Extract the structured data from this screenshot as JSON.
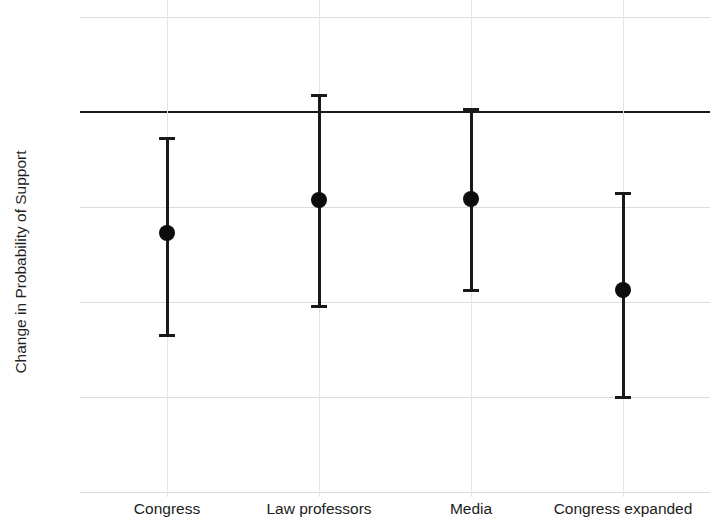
{
  "chart_data": {
    "type": "scatter",
    "title": "",
    "subtitle": "",
    "xlabel": "",
    "ylabel": "Change in Probability of Support",
    "categories": [
      "Congress",
      "Law professors",
      "Media",
      "Congress expanded"
    ],
    "values": [
      -0.127,
      -0.093,
      -0.092,
      -0.187
    ],
    "ci_low": [
      -0.235,
      -0.204,
      -0.187,
      -0.3
    ],
    "ci_high": [
      -0.027,
      0.018,
      0.003,
      -0.085
    ],
    "series": [
      {
        "name": "Change in Probability of Support",
        "values": [
          -0.127,
          -0.093,
          -0.092,
          -0.187
        ],
        "ci_low": [
          -0.235,
          -0.204,
          -0.187,
          -0.3
        ],
        "ci_high": [
          -0.027,
          0.018,
          0.003,
          -0.085
        ]
      }
    ],
    "points": [
      {
        "category": "Congress",
        "estimate": -0.127,
        "ci_low": -0.235,
        "ci_high": -0.027
      },
      {
        "category": "Law professors",
        "estimate": -0.093,
        "ci_low": -0.204,
        "ci_high": 0.018
      },
      {
        "category": "Media",
        "estimate": -0.092,
        "ci_low": -0.187,
        "ci_high": 0.003
      },
      {
        "category": "Congress expanded",
        "estimate": -0.187,
        "ci_low": -0.3,
        "ci_high": -0.085
      }
    ],
    "ylim": [
      -0.4,
      0.1
    ],
    "yticks": [
      0.1,
      0,
      -0.1,
      -0.2,
      -0.3,
      -0.4
    ],
    "ytick_labels": [
      ".1",
      "0",
      "-.1",
      "-.2",
      "-.3",
      "-.4"
    ],
    "grid": true,
    "zero_line": true,
    "legend": null,
    "legend_position": "none",
    "marker": "filled-circle",
    "colors": {
      "marker": "#0d0d0d",
      "error_bar": "#191919",
      "gridline": "#dcdcdc",
      "zero_line": "#1a1a1a",
      "background": "#ffffff",
      "text": "#1c1c1c"
    }
  },
  "axis": {
    "y_title": "Change in Probability of Support"
  }
}
